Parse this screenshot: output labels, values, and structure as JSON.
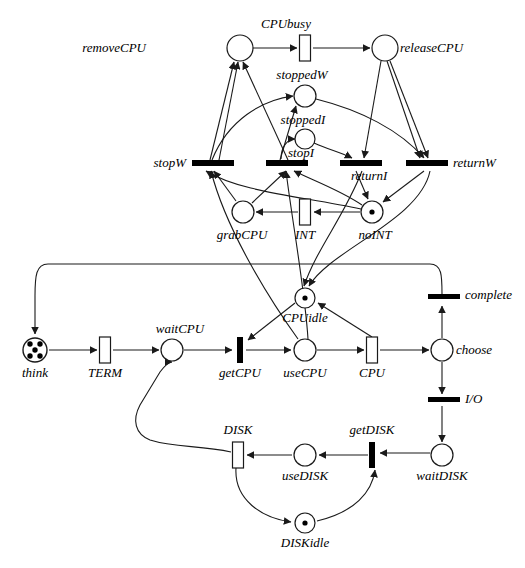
{
  "diagram": {
    "type": "petri-net",
    "colors": {
      "stroke": "#1a1a1a",
      "fill": "#ffffff",
      "token": "#000000",
      "background": "#ffffff"
    }
  },
  "places": [
    {
      "id": "removeCPU",
      "label": "removeCPU",
      "cx": 240,
      "cy": 48,
      "r": 13,
      "tokens": 0,
      "label_pos": "left"
    },
    {
      "id": "releaseCPU",
      "label": "releaseCPU",
      "cx": 385,
      "cy": 48,
      "r": 13,
      "tokens": 0,
      "label_pos": "right"
    },
    {
      "id": "stoppedW",
      "label": "stoppedW",
      "cx": 305,
      "cy": 96,
      "r": 11,
      "tokens": 0,
      "label_pos": "above"
    },
    {
      "id": "stoppedI",
      "label": "stoppedI",
      "cx": 305,
      "cy": 139,
      "r": 10,
      "tokens": 0,
      "label_pos": "above"
    },
    {
      "id": "grabCPU",
      "label": "grabCPU",
      "cx": 243,
      "cy": 212,
      "r": 11,
      "tokens": 0,
      "label_pos": "below"
    },
    {
      "id": "noINT",
      "label": "noINT",
      "cx": 372,
      "cy": 212,
      "r": 11,
      "tokens": 1,
      "label_pos": "below"
    },
    {
      "id": "CPUidle",
      "label": "CPUidle",
      "cx": 305,
      "cy": 298,
      "r": 10,
      "tokens": 1,
      "label_pos": "below"
    },
    {
      "id": "think",
      "label": "think",
      "cx": 35,
      "cy": 350,
      "r": 12,
      "tokens": 5,
      "label_pos": "below"
    },
    {
      "id": "waitCPU",
      "label": "waitCPU",
      "cx": 172,
      "cy": 350,
      "r": 11,
      "tokens": 0,
      "label_pos": "above"
    },
    {
      "id": "useCPU",
      "label": "useCPU",
      "cx": 305,
      "cy": 350,
      "r": 11,
      "tokens": 0,
      "label_pos": "below"
    },
    {
      "id": "choose",
      "label": "choose",
      "cx": 442,
      "cy": 350,
      "r": 11,
      "tokens": 0,
      "label_pos": "right"
    },
    {
      "id": "waitDISK",
      "label": "waitDISK",
      "cx": 442,
      "cy": 455,
      "r": 11,
      "tokens": 0,
      "label_pos": "below"
    },
    {
      "id": "useDISK",
      "label": "useDISK",
      "cx": 305,
      "cy": 455,
      "r": 11,
      "tokens": 0,
      "label_pos": "below"
    },
    {
      "id": "DISKidle",
      "label": "DISKidle",
      "cx": 305,
      "cy": 523,
      "r": 10,
      "tokens": 1,
      "label_pos": "below"
    }
  ],
  "transitions": [
    {
      "id": "CPUbusy",
      "label": "CPUbusy",
      "x": 305,
      "y": 48,
      "w": 11,
      "h": 26,
      "shape": "box",
      "label_pos": "above"
    },
    {
      "id": "stopW",
      "label": "stopW",
      "x": 202,
      "y": 163,
      "w": 42,
      "h": 6,
      "shape": "barh",
      "label_pos": "left"
    },
    {
      "id": "stopI",
      "label": "stopI",
      "x": 277,
      "y": 163,
      "w": 42,
      "h": 6,
      "shape": "barh",
      "label_pos": "aboveright"
    },
    {
      "id": "returnI",
      "label": "returnI",
      "x": 348,
      "y": 163,
      "w": 42,
      "h": 6,
      "shape": "barh",
      "label_pos": "below"
    },
    {
      "id": "returnW",
      "label": "returnW",
      "x": 415,
      "y": 163,
      "w": 42,
      "h": 6,
      "shape": "barh",
      "label_pos": "right"
    },
    {
      "id": "INT",
      "label": "INT",
      "x": 305,
      "y": 212,
      "w": 11,
      "h": 26,
      "shape": "box",
      "label_pos": "below"
    },
    {
      "id": "complete",
      "label": "complete",
      "x": 442,
      "y": 298,
      "w": 30,
      "h": 6,
      "shape": "barh",
      "label_pos": "right"
    },
    {
      "id": "getCPU",
      "label": "getCPU",
      "x": 240,
      "y": 350,
      "w": 7,
      "h": 26,
      "shape": "barfill",
      "label_pos": "below"
    },
    {
      "id": "CPU",
      "label": "CPU",
      "x": 372,
      "y": 350,
      "w": 11,
      "h": 26,
      "shape": "box",
      "label_pos": "below"
    },
    {
      "id": "IO",
      "label": "I/O",
      "x": 442,
      "y": 400,
      "w": 30,
      "h": 6,
      "shape": "barh",
      "label_pos": "right"
    },
    {
      "id": "TERM",
      "label": "TERM",
      "x": 105,
      "y": 350,
      "w": 11,
      "h": 26,
      "shape": "box",
      "label_pos": "below"
    },
    {
      "id": "getDISK",
      "label": "getDISK",
      "x": 372,
      "y": 455,
      "w": 7,
      "h": 26,
      "shape": "barfill",
      "label_pos": "above"
    },
    {
      "id": "DISK",
      "label": "DISK",
      "x": 238,
      "y": 455,
      "w": 11,
      "h": 26,
      "shape": "box",
      "label_pos": "above"
    }
  ],
  "arcs": [
    {
      "from": "removeCPU",
      "to": "CPUbusy"
    },
    {
      "from": "CPUbusy",
      "to": "releaseCPU"
    },
    {
      "from": "stopW",
      "to": "removeCPU"
    },
    {
      "from": "stopI",
      "to": "removeCPU"
    },
    {
      "from": "stopW",
      "to": "stoppedW"
    },
    {
      "from": "stopI",
      "to": "stoppedI"
    },
    {
      "from": "stoppedW",
      "to": "returnW"
    },
    {
      "from": "stoppedI",
      "to": "returnI"
    },
    {
      "from": "releaseCPU",
      "to": "returnI"
    },
    {
      "from": "releaseCPU",
      "to": "returnW"
    },
    {
      "from": "grabCPU",
      "to": "stopW"
    },
    {
      "from": "grabCPU",
      "to": "stopI"
    },
    {
      "from": "noINT",
      "to": "stopW"
    },
    {
      "from": "noINT",
      "to": "stopI"
    },
    {
      "from": "returnI",
      "to": "noINT"
    },
    {
      "from": "returnW",
      "to": "noINT"
    },
    {
      "from": "INT",
      "to": "grabCPU"
    },
    {
      "from": "noINT",
      "to": "INT"
    },
    {
      "from": "returnW",
      "to": "CPUidle"
    },
    {
      "from": "returnI",
      "to": "CPUidle"
    },
    {
      "from": "CPUidle",
      "to": "getCPU"
    },
    {
      "from": "getCPU",
      "to": "useCPU"
    },
    {
      "from": "useCPU",
      "to": "CPU"
    },
    {
      "from": "CPU",
      "to": "CPUidle"
    },
    {
      "from": "think",
      "to": "TERM"
    },
    {
      "from": "TERM",
      "to": "waitCPU"
    },
    {
      "from": "waitCPU",
      "to": "getCPU"
    },
    {
      "from": "CPU",
      "to": "choose"
    },
    {
      "from": "choose",
      "to": "complete"
    },
    {
      "from": "choose",
      "to": "IO"
    },
    {
      "from": "complete",
      "to": "think"
    },
    {
      "from": "IO",
      "to": "waitDISK"
    },
    {
      "from": "waitDISK",
      "to": "getDISK"
    },
    {
      "from": "getDISK",
      "to": "useDISK"
    },
    {
      "from": "useDISK",
      "to": "DISK"
    },
    {
      "from": "DISK",
      "to": "waitCPU"
    },
    {
      "from": "DISKidle",
      "to": "getDISK"
    },
    {
      "from": "DISK",
      "to": "DISKidle"
    },
    {
      "from": "useCPU",
      "to": "stopW"
    },
    {
      "from": "useCPU",
      "to": "stopI"
    }
  ],
  "labels": {
    "removeCPU": "removeCPU",
    "CPUbusy": "CPUbusy",
    "releaseCPU": "releaseCPU",
    "stoppedW": "stoppedW",
    "stoppedI": "stoppedI",
    "stopW": "stopW",
    "stopI": "stopI",
    "returnI": "returnI",
    "returnW": "returnW",
    "grabCPU": "grabCPU",
    "INT": "INT",
    "noINT": "noINT",
    "CPUidle": "CPUidle",
    "complete": "complete",
    "think": "think",
    "TERM": "TERM",
    "waitCPU": "waitCPU",
    "getCPU": "getCPU",
    "useCPU": "useCPU",
    "CPU": "CPU",
    "choose": "choose",
    "IO": "I/O",
    "DISK": "DISK",
    "useDISK": "useDISK",
    "getDISK": "getDISK",
    "waitDISK": "waitDISK",
    "DISKidle": "DISKidle"
  }
}
